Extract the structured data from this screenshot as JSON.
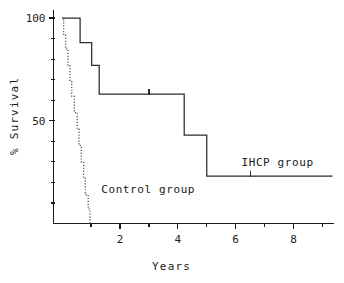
{
  "chart_data": {
    "type": "line",
    "title": "",
    "subtitle": "",
    "xlabel": "Years",
    "ylabel": "% Survival",
    "xlim": [
      -0.3,
      9.4
    ],
    "ylim": [
      0,
      104
    ],
    "grid": false,
    "legend_position": "inline-annotations",
    "style": "Kaplan-Meier step survival curves",
    "x_ticks_major": [
      2,
      4,
      6,
      8
    ],
    "x_tick_labels": [
      "2",
      "4",
      "6",
      "8"
    ],
    "x_ticks_minor": [
      1,
      3,
      5,
      7,
      9
    ],
    "y_ticks_major": [
      50,
      100
    ],
    "y_tick_labels": [
      "50",
      "100"
    ],
    "y_ticks_minor": [
      10,
      20,
      30,
      40,
      60,
      70,
      80,
      90
    ],
    "series": [
      {
        "name": "IHCP group",
        "style": "solid",
        "label_text": "IHCP group",
        "label_x": 6.2,
        "label_y": 28,
        "steps": [
          {
            "x": 0.0,
            "y": 100
          },
          {
            "x": 0.62,
            "y": 100
          },
          {
            "x": 0.62,
            "y": 88
          },
          {
            "x": 1.02,
            "y": 88
          },
          {
            "x": 1.02,
            "y": 77
          },
          {
            "x": 1.28,
            "y": 77
          },
          {
            "x": 1.28,
            "y": 63
          },
          {
            "x": 4.22,
            "y": 63
          },
          {
            "x": 4.22,
            "y": 43
          },
          {
            "x": 5.0,
            "y": 43
          },
          {
            "x": 5.0,
            "y": 23
          },
          {
            "x": 9.35,
            "y": 23
          }
        ],
        "censored": [
          {
            "x": 3.0,
            "y": 63
          },
          {
            "x": 6.5,
            "y": 23
          }
        ]
      },
      {
        "name": "Control group",
        "style": "dotted",
        "label_text": "Control group",
        "label_x": 1.35,
        "label_y": 15,
        "steps": [
          {
            "x": 0.0,
            "y": 100
          },
          {
            "x": 0.05,
            "y": 100
          },
          {
            "x": 0.05,
            "y": 92
          },
          {
            "x": 0.12,
            "y": 92
          },
          {
            "x": 0.12,
            "y": 85
          },
          {
            "x": 0.2,
            "y": 85
          },
          {
            "x": 0.2,
            "y": 77
          },
          {
            "x": 0.27,
            "y": 77
          },
          {
            "x": 0.27,
            "y": 69
          },
          {
            "x": 0.33,
            "y": 69
          },
          {
            "x": 0.33,
            "y": 62
          },
          {
            "x": 0.42,
            "y": 62
          },
          {
            "x": 0.42,
            "y": 54
          },
          {
            "x": 0.52,
            "y": 54
          },
          {
            "x": 0.52,
            "y": 46
          },
          {
            "x": 0.58,
            "y": 46
          },
          {
            "x": 0.58,
            "y": 38
          },
          {
            "x": 0.66,
            "y": 38
          },
          {
            "x": 0.66,
            "y": 30
          },
          {
            "x": 0.74,
            "y": 30
          },
          {
            "x": 0.74,
            "y": 22
          },
          {
            "x": 0.8,
            "y": 22
          },
          {
            "x": 0.8,
            "y": 14
          },
          {
            "x": 0.9,
            "y": 14
          },
          {
            "x": 0.9,
            "y": 7
          },
          {
            "x": 0.96,
            "y": 7
          },
          {
            "x": 0.96,
            "y": 0
          }
        ],
        "censored": []
      }
    ],
    "colors": {
      "axis": "#1a1a1a",
      "ihcp_curve": "#2b2b2b",
      "control_curve": "#555555",
      "background": "#ffffff"
    }
  }
}
